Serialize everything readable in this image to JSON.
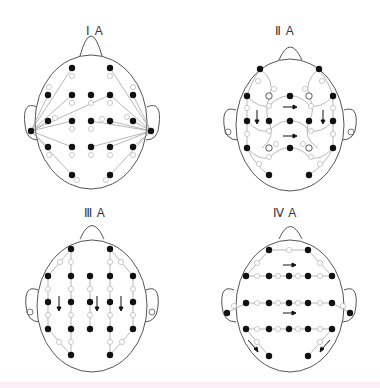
{
  "panels": [
    {
      "id": "IA",
      "label": "Ⅰ A"
    },
    {
      "id": "IIA",
      "label": "Ⅱ A"
    },
    {
      "id": "IIIA",
      "label": "Ⅲ A"
    },
    {
      "id": "IVA",
      "label": "Ⅳ A"
    }
  ],
  "colors": {
    "outline": "#555555",
    "electrode": "#111111",
    "line": "#888888",
    "label": "#aaaaaa",
    "band": "#fbeef6"
  },
  "panel_IA": {
    "electrodes_labels": [
      "1",
      "2",
      "3",
      "4",
      "5",
      "6",
      "7",
      "8",
      "9",
      "10",
      "11",
      "12",
      "13",
      "14",
      "15",
      "16",
      "17",
      "18"
    ]
  },
  "panel_IIA": {
    "arrows": [
      "down-left",
      "right-upper",
      "right-lower",
      "down-right"
    ]
  },
  "panel_IIIA": {
    "arrows": [
      "down",
      "down",
      "down"
    ]
  },
  "panel_IVA": {
    "arrows": [
      "right-upper",
      "right-middle",
      "down-right-lower-left",
      "down-left-lower-right"
    ]
  }
}
